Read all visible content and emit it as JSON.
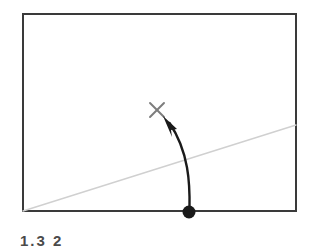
{
  "figure": {
    "background_color": "#ffffff",
    "frame": {
      "name": "plot-frame",
      "x": 22,
      "y": 13,
      "width": 275,
      "height": 199,
      "stroke_color": "#3a3a3a",
      "stroke_width": 2,
      "fill_color": "#ffffff"
    },
    "diagonal_line": {
      "name": "diagonal-guide-line",
      "x1": 22,
      "y1": 212,
      "x2": 297,
      "y2": 125,
      "stroke_color": "#d0d0d0",
      "stroke_width": 1.4
    },
    "target_marker": {
      "name": "x-target-marker",
      "symbol": "x-cross",
      "center_x": 157,
      "center_y": 110,
      "size": 15,
      "stroke_color": "#7d7d7d",
      "stroke_width": 1.8
    },
    "origin_point": {
      "name": "origin-dot",
      "center_x": 189,
      "center_y": 212,
      "radius": 6.5,
      "fill_color": "#1a1a1a"
    },
    "curved_arrow": {
      "name": "curved-arrow",
      "path": "M 189 210 C 189 180, 188 150, 167 121",
      "stroke_color": "#1a1a1a",
      "stroke_width": 2.4,
      "arrowhead": {
        "name": "arrowhead",
        "tip_x": 163,
        "tip_y": 116,
        "points": "163,116 177,129 171,130 172,137",
        "fill_color": "#1a1a1a"
      }
    }
  },
  "caption": {
    "text": "1.3 2",
    "color": "#4a4a4a",
    "cropped": true
  }
}
